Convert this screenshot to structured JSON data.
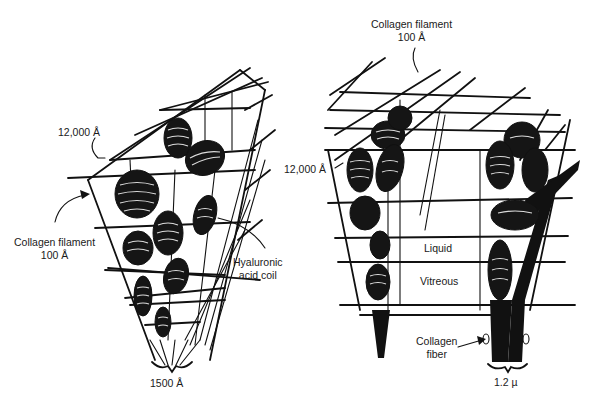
{
  "figure": {
    "left_diagram": {
      "labels": {
        "spacing": "12,000 Å",
        "collagen_filament_line1": "Collagen filament",
        "collagen_filament_line2": "100 Å",
        "hyaluronic_line1": "Hyaluronic",
        "hyaluronic_line2": "acid coil",
        "base_width": "1500 Å"
      }
    },
    "right_diagram": {
      "labels": {
        "collagen_filament_line1": "Collagen filament",
        "collagen_filament_line2": "100 Å",
        "spacing": "12,000 Å",
        "liquid": "Liquid",
        "vitreous": "Vitreous",
        "collagen_fiber_line1": "Collagen",
        "collagen_fiber_line2": "fiber",
        "base_width": "1.2 µ"
      }
    },
    "colors": {
      "ink": "#111111",
      "background": "#ffffff"
    }
  }
}
